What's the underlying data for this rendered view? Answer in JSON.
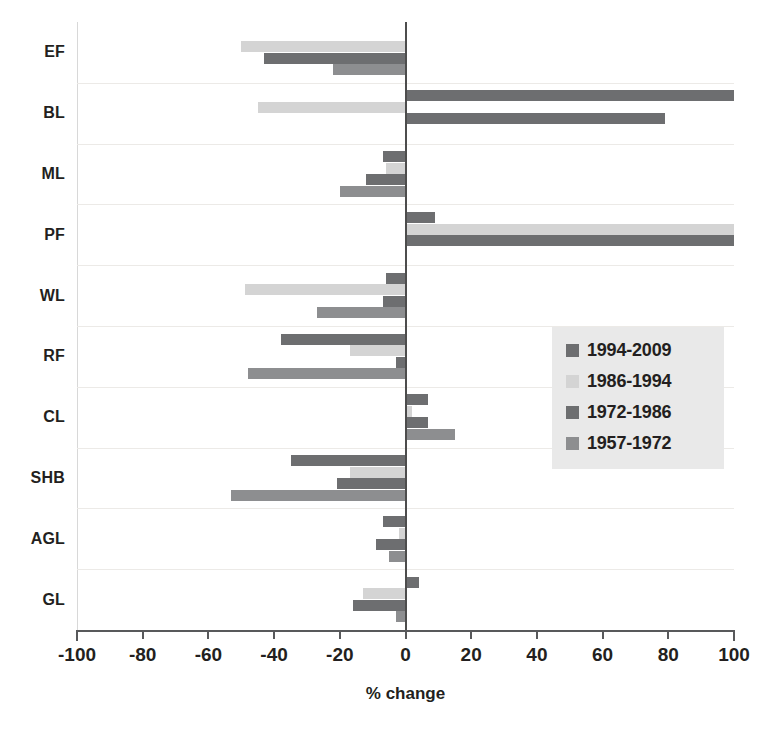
{
  "chart_data": {
    "type": "bar",
    "orientation": "horizontal",
    "title": "",
    "xlabel": "% change",
    "ylabel": "",
    "xlim": [
      -100,
      100
    ],
    "xticks": [
      -100,
      -80,
      -60,
      -40,
      -20,
      0,
      20,
      40,
      60,
      80,
      100
    ],
    "xtick_labels": [
      "-100",
      "-80",
      "-60",
      "-40",
      "-20",
      "0",
      "20",
      "40",
      "60",
      "80",
      "100"
    ],
    "grid": true,
    "grid_axis": "y",
    "legend_position": "center-right",
    "categories": [
      "EF",
      "BL",
      "ML",
      "PF",
      "WL",
      "RF",
      "CL",
      "SHB",
      "AGL",
      "GL"
    ],
    "series": [
      {
        "name": "1994-2009",
        "color": "#6d6e70",
        "values": [
          0,
          100,
          -7,
          9,
          -6,
          -38,
          7,
          -35,
          -7,
          4
        ]
      },
      {
        "name": "1986-1994",
        "color": "#d4d4d4",
        "values": [
          -50,
          -45,
          -6,
          100,
          -49,
          -17,
          2,
          -17,
          -2,
          -13
        ]
      },
      {
        "name": "1972-1986",
        "color": "#6d6e70",
        "values": [
          -43,
          79,
          -12,
          100,
          -7,
          -3,
          7,
          -21,
          -9,
          -16
        ]
      },
      {
        "name": "1957-1972",
        "color": "#8d8e90",
        "values": [
          -22,
          0,
          -20,
          0,
          -27,
          -48,
          15,
          -53,
          -5,
          -3
        ]
      }
    ]
  },
  "colors": {
    "series_1994_2009": "#6d6e70",
    "series_1986_1994": "#d4d4d4",
    "series_1972_1986": "#6d6e70",
    "series_1957_1972": "#8d8e90",
    "axis": "#58595b",
    "gridline": "#eceae7",
    "legend_background": "#e9e9e9",
    "text": "#231f20"
  },
  "legend": {
    "items": [
      {
        "label": "1994-2009",
        "color": "#6d6e70"
      },
      {
        "label": "1986-1994",
        "color": "#d4d4d4"
      },
      {
        "label": "1972-1986",
        "color": "#6d6e70"
      },
      {
        "label": "1957-1972",
        "color": "#8d8e90"
      }
    ]
  }
}
